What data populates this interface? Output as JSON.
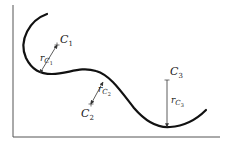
{
  "diagram": {
    "colors": {
      "axis": "#555555",
      "curve": "#111111",
      "arrow": "#333333",
      "text": "#222222",
      "background": "#ffffff"
    },
    "axes": {
      "y_axis": {
        "x": 13,
        "y_top": 5,
        "y_bottom": 137
      },
      "x_axis": {
        "y": 137,
        "x_left": 13,
        "x_right": 220
      }
    },
    "curve_path": "M47,14 C30,20 18,40 26,58 C32,70 40,74 52,74 C68,74 80,66 96,71 C110,75 120,90 134,108 C146,122 158,128 170,127 C186,126 198,118 206,110",
    "centers": [
      {
        "id": "C1",
        "base": "C",
        "subscript": "1",
        "point": [
          57,
          45
        ],
        "label_pos": [
          60,
          43
        ],
        "radius_label": {
          "base": "r",
          "sub": "C",
          "subsub": "1",
          "pos": [
            40,
            61
          ]
        },
        "arrow_to": [
          40,
          73
        ]
      },
      {
        "id": "C2",
        "base": "C",
        "subscript": "2",
        "point": [
          91,
          104
        ],
        "label_pos": [
          81,
          117
        ],
        "radius_label": {
          "base": "r",
          "sub": "C",
          "subsub": "2",
          "pos": [
            98,
            92
          ]
        },
        "arrow_to": [
          103,
          82
        ]
      },
      {
        "id": "C3",
        "base": "C",
        "subscript": "3",
        "point": [
          167,
          80
        ],
        "label_pos": [
          170,
          75
        ],
        "radius_label": {
          "base": "r",
          "sub": "C",
          "subsub": "3",
          "pos": [
            171,
            103
          ]
        },
        "arrow_to": [
          167,
          127
        ]
      }
    ]
  }
}
